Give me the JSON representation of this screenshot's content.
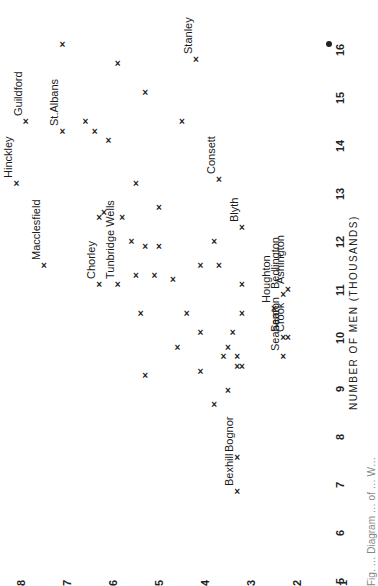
{
  "chart_data": {
    "type": "scatter",
    "orientation": "page rotated 90deg counter-clockwise",
    "title": "",
    "xlabel": "NUMBER OF MEN (THOUSANDS)",
    "ylabel": "",
    "xlim": [
      5,
      16
    ],
    "ylim": [
      1,
      8
    ],
    "x_ticks": [
      "5",
      "6",
      "7",
      "8",
      "9",
      "10",
      "11",
      "12",
      "13",
      "14",
      "15",
      "16"
    ],
    "y_ticks": [
      "8",
      "7",
      "6",
      "5",
      "4",
      "3",
      "2",
      "1"
    ],
    "grid": false,
    "marker": "x",
    "labeled_points": [
      {
        "label": "Hinckley",
        "x": 13.2,
        "y": 8.1
      },
      {
        "label": "Guildford",
        "x": 14.5,
        "y": 7.9
      },
      {
        "label": "St.Albans",
        "x": 14.3,
        "y": 7.1
      },
      {
        "label": "Macclesfield",
        "x": 11.5,
        "y": 7.5
      },
      {
        "label": "Stanley",
        "x": 15.8,
        "y": 4.2
      },
      {
        "label": "Consett",
        "x": 13.3,
        "y": 3.7
      },
      {
        "label": "Chorley",
        "x": 11.1,
        "y": 6.3
      },
      {
        "label": "Tunbridge Wells",
        "x": 11.1,
        "y": 5.9
      },
      {
        "label": "Blyth",
        "x": 12.3,
        "y": 3.2
      },
      {
        "label": "Houghton",
        "x": 10.6,
        "y": 2.5
      },
      {
        "label": "Bedlington",
        "x": 10.9,
        "y": 2.3
      },
      {
        "label": "Ashington",
        "x": 11.0,
        "y": 2.2
      },
      {
        "label": "Seaton",
        "x": 10.0,
        "y": 2.3
      },
      {
        "label": "Crook",
        "x": 10.0,
        "y": 2.2
      },
      {
        "label": "Seaham",
        "x": 9.6,
        "y": 2.3
      },
      {
        "label": "Bexhill",
        "x": 6.8,
        "y": 3.3
      },
      {
        "label": "Bognor",
        "x": 7.5,
        "y": 3.3
      }
    ],
    "points": [
      {
        "x": 16.1,
        "y": 7.1
      },
      {
        "x": 15.7,
        "y": 5.9
      },
      {
        "x": 15.1,
        "y": 5.3
      },
      {
        "x": 14.5,
        "y": 4.5
      },
      {
        "x": 14.5,
        "y": 6.6
      },
      {
        "x": 14.3,
        "y": 6.4
      },
      {
        "x": 14.1,
        "y": 6.1
      },
      {
        "x": 13.2,
        "y": 5.5
      },
      {
        "x": 12.5,
        "y": 6.3
      },
      {
        "x": 12.6,
        "y": 6.2
      },
      {
        "x": 12.5,
        "y": 5.8
      },
      {
        "x": 12.7,
        "y": 5.0
      },
      {
        "x": 12.0,
        "y": 5.6
      },
      {
        "x": 11.9,
        "y": 5.3
      },
      {
        "x": 11.9,
        "y": 5.0
      },
      {
        "x": 12.0,
        "y": 3.8
      },
      {
        "x": 11.5,
        "y": 4.1
      },
      {
        "x": 11.5,
        "y": 3.7
      },
      {
        "x": 11.3,
        "y": 5.5
      },
      {
        "x": 11.3,
        "y": 5.1
      },
      {
        "x": 11.2,
        "y": 4.7
      },
      {
        "x": 11.1,
        "y": 3.2
      },
      {
        "x": 10.5,
        "y": 4.4
      },
      {
        "x": 10.5,
        "y": 5.4
      },
      {
        "x": 10.5,
        "y": 3.2
      },
      {
        "x": 10.1,
        "y": 4.1
      },
      {
        "x": 10.1,
        "y": 3.4
      },
      {
        "x": 9.8,
        "y": 4.6
      },
      {
        "x": 9.8,
        "y": 3.5
      },
      {
        "x": 9.6,
        "y": 3.6
      },
      {
        "x": 9.6,
        "y": 3.3
      },
      {
        "x": 9.4,
        "y": 3.3
      },
      {
        "x": 9.4,
        "y": 3.2
      },
      {
        "x": 9.3,
        "y": 4.1
      },
      {
        "x": 9.2,
        "y": 5.3
      },
      {
        "x": 8.9,
        "y": 3.5
      },
      {
        "x": 8.6,
        "y": 3.8
      }
    ],
    "special_marker": {
      "type": "filled-dot",
      "near_tick": "16"
    }
  },
  "caption_partial": "Fig. … Diagram … of … W…",
  "marker_glyph": "×"
}
